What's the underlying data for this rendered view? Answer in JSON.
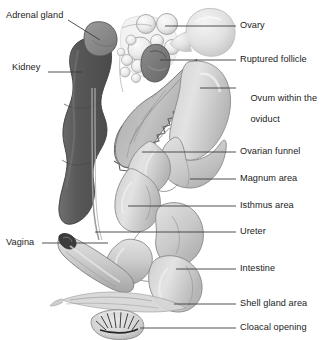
{
  "figure": {
    "background_color": "#ffffff",
    "label_color": "#1b1b1b",
    "leader_line_color": "#3c3c3c"
  },
  "palette": {
    "kidney_dark": "#575757",
    "kidney_mid": "#6a6a6a",
    "adrenal": "#8e8e8e",
    "ruptured_follicle": "#7a7a7a",
    "organ_light": "#dcdcdc",
    "organ_mid": "#c6c6c6",
    "organ_shadow": "#a8a8a8",
    "outline": "#6e6e6e",
    "funnel": "#b4b4b4",
    "follicle_fill": "#efefef",
    "ovum_fill": "#e6e6e6"
  },
  "labels": {
    "left": [
      {
        "id": "adrenal-gland",
        "text": "Adrenal gland",
        "x": 6,
        "y": 16
      },
      {
        "id": "kidney",
        "text": "Kidney",
        "x": 12,
        "y": 68
      },
      {
        "id": "vagina",
        "text": "Vagina",
        "x": 6,
        "y": 239
      }
    ],
    "right": [
      {
        "id": "ovary",
        "text": "Ovary",
        "x": 240,
        "y": 22
      },
      {
        "id": "ruptured-follicle",
        "text": "Ruptured follicle",
        "x": 240,
        "y": 56
      },
      {
        "id": "ovum-within-the-oviduct",
        "text": "Ovum within the",
        "text2": "oviduct",
        "x": 240,
        "y": 83
      },
      {
        "id": "ovarian-funnel",
        "text": "Ovarian funnel",
        "x": 240,
        "y": 148
      },
      {
        "id": "magnum-area",
        "text": "Magnum area",
        "x": 240,
        "y": 175
      },
      {
        "id": "isthmus-area",
        "text": "Isthmus area",
        "x": 240,
        "y": 202
      },
      {
        "id": "ureter",
        "text": "Ureter",
        "x": 240,
        "y": 228
      },
      {
        "id": "intestine",
        "text": "Intestine",
        "x": 240,
        "y": 265
      },
      {
        "id": "shell-gland-area",
        "text": "Shell gland area",
        "x": 240,
        "y": 300
      },
      {
        "id": "cloacal-opening",
        "text": "Cloacal opening",
        "x": 240,
        "y": 324
      }
    ]
  },
  "structures": [
    {
      "id": "adrenal-gland",
      "name": "Adrenal gland"
    },
    {
      "id": "kidney",
      "name": "Kidney"
    },
    {
      "id": "ovary",
      "name": "Ovary"
    },
    {
      "id": "ruptured-follicle",
      "name": "Ruptured follicle"
    },
    {
      "id": "ovum-within-the-oviduct",
      "name": "Ovum within the oviduct"
    },
    {
      "id": "ovarian-funnel",
      "name": "Ovarian funnel"
    },
    {
      "id": "magnum-area",
      "name": "Magnum area"
    },
    {
      "id": "isthmus-area",
      "name": "Isthmus area"
    },
    {
      "id": "ureter",
      "name": "Ureter"
    },
    {
      "id": "intestine",
      "name": "Intestine"
    },
    {
      "id": "shell-gland-area",
      "name": "Shell gland area"
    },
    {
      "id": "vagina",
      "name": "Vagina"
    },
    {
      "id": "cloacal-opening",
      "name": "Cloacal opening"
    }
  ]
}
